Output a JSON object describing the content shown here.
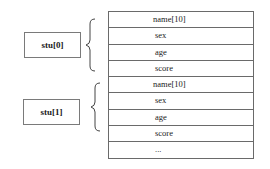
{
  "diagram": {
    "labels": [
      {
        "text": "stu[0]"
      },
      {
        "text": "stu[1]"
      }
    ],
    "rows": [
      {
        "text": "name[10]"
      },
      {
        "text": "sex"
      },
      {
        "text": "age"
      },
      {
        "text": "score"
      },
      {
        "text": "name[10]"
      },
      {
        "text": "sex"
      },
      {
        "text": "age"
      },
      {
        "text": "score"
      },
      {
        "text": "..."
      }
    ]
  }
}
